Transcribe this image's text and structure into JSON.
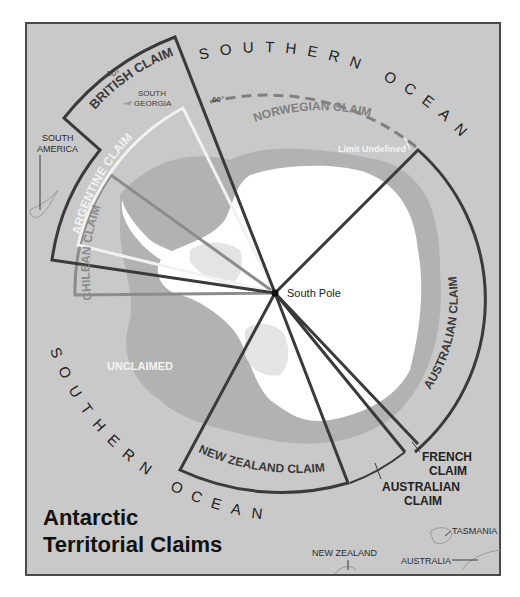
{
  "title_line1": "Antarctic",
  "title_line2": "Territorial Claims",
  "ocean_top": "SOUTHERN OCEAN",
  "ocean_bottom": "SOUTHERN OCEAN",
  "south_pole": "South Pole",
  "unclaimed": "UNCLAIMED",
  "limit_undefined": "Limit Undefined",
  "lat_60_a": "60°",
  "lat_60_b": "60°",
  "lat_50": "50°",
  "claims": {
    "british": "BRITISH CLAIM",
    "argentine": "ARGENTINE CLAIM",
    "chilean": "CHILEAN CLAIM",
    "norwegian": "NORWEGIAN CLAIM",
    "australian_east": "AUSTRALIAN CLAIM",
    "new_zealand": "NEW ZEALAND CLAIM",
    "french_1": "FRENCH",
    "french_2": "CLAIM",
    "australian_west_1": "AUSTRALIAN",
    "australian_west_2": "CLAIM"
  },
  "places": {
    "south_georgia_1": "SOUTH",
    "south_georgia_2": "GEORGIA",
    "south_america_1": "SOUTH",
    "south_america_2": "AMERICA",
    "new_zealand": "NEW ZEALAND",
    "tasmania": "TASMANIA",
    "australia": "AUSTRALIA"
  },
  "colors": {
    "ocean": "#c9c9c9",
    "shelf": "#b0b0b0",
    "ice": "#ffffff",
    "land_gray": "#dcdcdc",
    "claim_line": "#3a3a3a",
    "argentine_line": "#f2f2f2",
    "chilean_line": "#8c8c8c",
    "norwegian_line": "#808080"
  }
}
